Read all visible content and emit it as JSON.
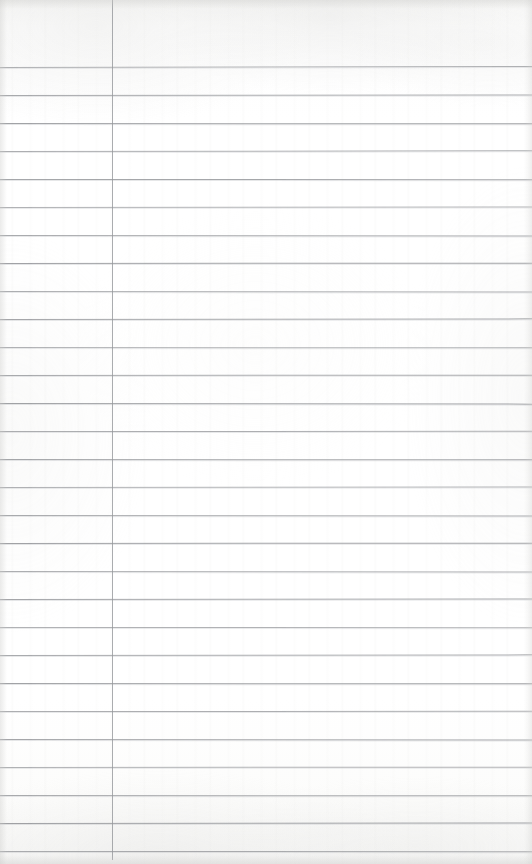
{
  "document": {
    "kind": "ruled-notepaper-scan",
    "description": "Blank lined notepad page",
    "written_content": "",
    "page_width": 532,
    "page_height": 864,
    "paper_color": "#fdfdfd",
    "rule_color": "#8d8f93",
    "margin_rule_color": "#95979b"
  },
  "ruling": {
    "horizontal_line_count": 29,
    "first_line_y": 67,
    "line_spacing": 28,
    "last_line_y": 851,
    "line_thickness": 1,
    "line_left_x": 0,
    "line_right_x": 532,
    "line_positions": [
      67,
      95,
      123,
      151,
      179,
      207,
      235,
      263,
      291,
      319,
      347,
      375,
      403,
      431,
      459,
      487,
      515,
      543,
      571,
      599,
      627,
      655,
      683,
      711,
      739,
      767,
      795,
      823,
      851
    ],
    "line_tilts": [
      -0.1,
      -0.06,
      0.04,
      -0.08,
      0.02,
      -0.05,
      0.06,
      -0.03,
      0.05,
      -0.07,
      0.03,
      -0.04,
      0.07,
      -0.02,
      0.04,
      -0.06,
      0.05,
      -0.03,
      0.06,
      -0.05,
      0.02,
      -0.07,
      0.04,
      -0.02,
      0.06,
      -0.04,
      0.03,
      -0.06,
      0.02
    ]
  },
  "margin_rule": {
    "x": 112,
    "top_y": 0,
    "bottom_y": 860,
    "thickness": 1,
    "orientation": "vertical"
  }
}
